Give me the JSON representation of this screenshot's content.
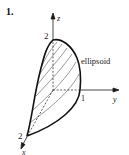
{
  "figure": {
    "number": "1.",
    "shape_label": "ellipsoid",
    "axes": {
      "x": {
        "label": "x",
        "tick": "2"
      },
      "y": {
        "label": "y",
        "tick": "1"
      },
      "z": {
        "label": "z",
        "tick": "2"
      }
    },
    "colors": {
      "ink": "#1a1a1a",
      "background": "#ffffff"
    }
  }
}
